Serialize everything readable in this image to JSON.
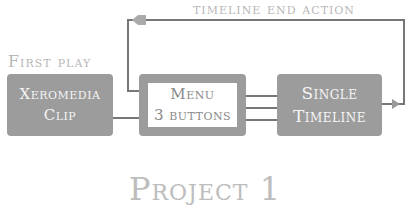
{
  "diagram": {
    "nodes": [
      {
        "id": "xeromedia-clip",
        "lines": [
          "Xeromedia",
          "Clip"
        ]
      },
      {
        "id": "menu",
        "lines": [
          "Menu",
          "3 buttons"
        ]
      },
      {
        "id": "single-timeline",
        "lines": [
          "Single",
          "Timeline"
        ]
      }
    ],
    "labels": {
      "first_play": "First play",
      "timeline_end_action": "timeline end action",
      "project_title": "Project 1"
    },
    "edges": [
      {
        "from": "xeromedia-clip",
        "to": "menu"
      },
      {
        "from": "menu",
        "to": "single-timeline",
        "count": 3
      },
      {
        "from": "single-timeline",
        "to": "menu",
        "label": "timeline end action"
      }
    ],
    "colors": {
      "box": "#9c9c9c",
      "box_text": "#f4f4f4",
      "wire": "#777777",
      "label": "#b8b8b8"
    }
  }
}
